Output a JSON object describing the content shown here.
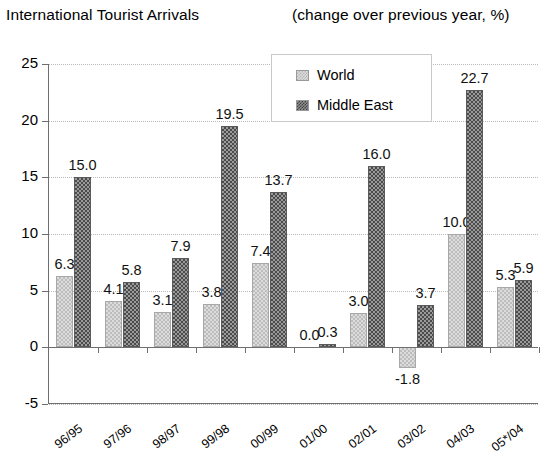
{
  "header": {
    "title": "International Tourist Arrivals",
    "subtitle": "(change over previous year, %)"
  },
  "legend": {
    "position": "top-center-inside",
    "entries": [
      {
        "label": "World",
        "swatch": "light-checker-swatch",
        "color": "#dcdcdc"
      },
      {
        "label": "Middle East",
        "swatch": "dark-checker-swatch",
        "color": "#6b6b6b"
      }
    ]
  },
  "axes": {
    "y": {
      "ticks": [
        "25",
        "20",
        "15",
        "10",
        "5",
        "0",
        "-5"
      ],
      "values": [
        25,
        20,
        15,
        10,
        5,
        0,
        -5
      ],
      "min": -5,
      "max": 25,
      "step": 5,
      "grid": true
    },
    "x": {
      "ticks": [
        "96/95",
        "97/96",
        "98/97",
        "99/98",
        "00/99",
        "01/00",
        "02/01",
        "03/02",
        "04/03",
        "05*/04"
      ]
    }
  },
  "chart_data": {
    "type": "bar",
    "title": "International Tourist Arrivals",
    "subtitle": "(change over previous year, %)",
    "xlabel": "",
    "ylabel": "",
    "ylim": [
      -5,
      25
    ],
    "ytick_step": 5,
    "grid": true,
    "legend_position": "top-center-inside",
    "categories": [
      "96/95",
      "97/96",
      "98/97",
      "99/98",
      "00/99",
      "01/00",
      "02/01",
      "03/02",
      "04/03",
      "05*/04"
    ],
    "series": [
      {
        "name": "World",
        "color": "#dcdcdc",
        "values": [
          6.3,
          4.1,
          3.1,
          3.8,
          7.4,
          0.0,
          3.0,
          -1.8,
          10.0,
          5.3
        ],
        "labels": [
          "6.3",
          "4.1",
          "3.1",
          "3.8",
          "7.4",
          "0.0",
          "3.0",
          "-1.8",
          "10.0",
          "5.3"
        ]
      },
      {
        "name": "Middle East",
        "color": "#6b6b6b",
        "values": [
          15.0,
          5.8,
          7.9,
          19.5,
          13.7,
          0.3,
          16.0,
          3.7,
          22.7,
          5.9
        ],
        "labels": [
          "15.0",
          "5.8",
          "7.9",
          "19.5",
          "13.7",
          "0.3",
          "16.0",
          "3.7",
          "22.7",
          "5.9"
        ]
      }
    ]
  }
}
